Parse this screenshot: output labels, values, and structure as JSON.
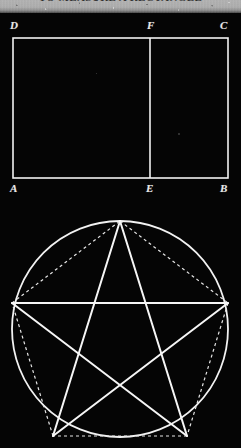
{
  "page": {
    "background_color": "#000000",
    "ink_color": "#f0f0f0",
    "width": 241,
    "height": 448
  },
  "scan_header": {
    "running_title": "TO MEASURE A RECTANGLE",
    "folio": "17",
    "strip_color": "#b3b3b3"
  },
  "figures": [
    {
      "id": "figure-rectangle",
      "name": "rectangle-with-divider",
      "type": "geometric-diagram",
      "caption": "",
      "shape": "rectangle",
      "vertices": [
        {
          "label": "A",
          "x": 13,
          "y": 178,
          "role": "bottom-left-corner"
        },
        {
          "label": "B",
          "x": 228,
          "y": 178,
          "role": "bottom-right-corner"
        },
        {
          "label": "C",
          "x": 228,
          "y": 38,
          "role": "top-right-corner"
        },
        {
          "label": "D",
          "x": 13,
          "y": 38,
          "role": "top-left-corner"
        },
        {
          "label": "E",
          "x": 150,
          "y": 178,
          "role": "point-on-base"
        },
        {
          "label": "F",
          "x": 150,
          "y": 38,
          "role": "point-on-top"
        }
      ],
      "segments": [
        {
          "from": "A",
          "to": "B",
          "style": "solid"
        },
        {
          "from": "B",
          "to": "C",
          "style": "solid"
        },
        {
          "from": "C",
          "to": "D",
          "style": "solid"
        },
        {
          "from": "D",
          "to": "A",
          "style": "solid"
        },
        {
          "from": "E",
          "to": "F",
          "style": "solid"
        }
      ],
      "labels": [
        "D",
        "F",
        "C",
        "A",
        "E",
        "B"
      ]
    },
    {
      "id": "figure-pentagram",
      "name": "pentagram-in-circle",
      "type": "geometric-diagram",
      "caption": "",
      "shape": "pentagram inscribed in circle",
      "circle": {
        "cx": 120,
        "cy": 124,
        "r": 108,
        "style": "solid"
      },
      "vertices": [
        {
          "label": "",
          "x": 120,
          "y": 16,
          "role": "apex"
        },
        {
          "label": "",
          "x": 228,
          "y": 98,
          "role": "upper-right"
        },
        {
          "label": "",
          "x": 187,
          "y": 231,
          "role": "lower-right"
        },
        {
          "label": "",
          "x": 53,
          "y": 231,
          "role": "lower-left"
        },
        {
          "label": "",
          "x": 12,
          "y": 98,
          "role": "upper-left"
        }
      ],
      "star_segments_style": "solid",
      "pentagon_segments_style": "dashed",
      "star_chords": [
        [
          0,
          2
        ],
        [
          2,
          4
        ],
        [
          4,
          1
        ],
        [
          1,
          3
        ],
        [
          3,
          0
        ]
      ],
      "pentagon_edges": [
        [
          0,
          1
        ],
        [
          1,
          2
        ],
        [
          2,
          3
        ],
        [
          3,
          4
        ],
        [
          4,
          0
        ]
      ]
    }
  ],
  "annotations": {
    "solid_line_label": "construction line",
    "dashed_line_label": "chord of pentagon"
  }
}
